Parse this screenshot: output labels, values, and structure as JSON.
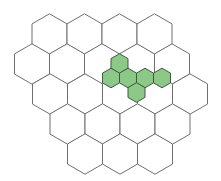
{
  "diagram": {
    "type": "hexagonal-grid",
    "background": "#ffffff",
    "large_grid": {
      "orientation": "pointy-top",
      "radius": 20.2,
      "stroke": "#6f6f6f",
      "fill": "#ffffff",
      "stroke_width": 1,
      "rows": [
        {
          "cy": 34,
          "cx": [
            49.5,
            84.5,
            119.5,
            154.5
          ]
        },
        {
          "cy": 64,
          "cx": [
            32,
            67,
            102,
            137,
            172
          ]
        },
        {
          "cy": 94,
          "cx": [
            50,
            85,
            120,
            155,
            190
          ]
        },
        {
          "cy": 124,
          "cx": [
            67.5,
            102.5,
            137.5,
            172.5
          ]
        },
        {
          "cy": 154,
          "cx": [
            85,
            120,
            155
          ]
        }
      ]
    },
    "small_cluster": {
      "orientation": "pointy-top",
      "radius": 9.8,
      "fill": "#8cc888",
      "stroke": "#3d5c3d",
      "stroke_width": 1,
      "cells": [
        {
          "cx": 119.5,
          "cy": 63.5
        },
        {
          "cx": 111,
          "cy": 78
        },
        {
          "cx": 128,
          "cy": 78
        },
        {
          "cx": 145,
          "cy": 78
        },
        {
          "cx": 162,
          "cy": 78
        },
        {
          "cx": 136.5,
          "cy": 92.5
        }
      ]
    }
  }
}
